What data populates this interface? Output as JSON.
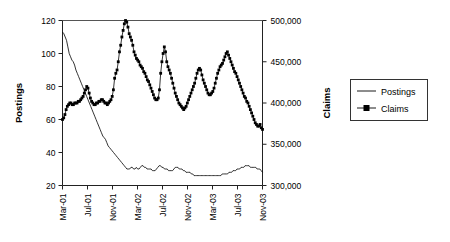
{
  "chart_data": {
    "type": "line",
    "title": "",
    "xlabel": "",
    "grid": false,
    "legend_position": "right",
    "x_tick_labels": [
      "Mar-01",
      "Jul-01",
      "Nov-01",
      "Mar-02",
      "Jul-02",
      "Nov-02",
      "Mar-03",
      "Jul-03",
      "Nov-03"
    ],
    "x": [
      "Mar-01",
      "Apr-01",
      "May-01",
      "Jun-01",
      "Jul-01",
      "Aug-01",
      "Sep-01",
      "Oct-01",
      "Nov-01",
      "Dec-01",
      "Jan-02",
      "Feb-02",
      "Mar-02",
      "Apr-02",
      "May-02",
      "Jun-02",
      "Jul-02",
      "Aug-02",
      "Sep-02",
      "Oct-02",
      "Nov-02",
      "Dec-02",
      "Jan-03",
      "Feb-03",
      "Mar-03",
      "Apr-03",
      "May-03",
      "Jun-03",
      "Jul-03",
      "Aug-03",
      "Sep-03",
      "Oct-03",
      "Nov-03"
    ],
    "left_axis": {
      "label": "Postings",
      "ylim": [
        20,
        120
      ],
      "ticks": [
        20,
        40,
        60,
        80,
        100,
        120
      ],
      "tick_labels": [
        "20",
        "40",
        "60",
        "80",
        "100",
        "120"
      ]
    },
    "right_axis": {
      "label": "Claims",
      "ylim": [
        300000,
        500000
      ],
      "ticks": [
        300000,
        350000,
        400000,
        450000,
        500000
      ],
      "tick_labels": [
        "300,000",
        "350,000",
        "400,000",
        "450,000",
        "500,000"
      ]
    },
    "series": [
      {
        "name": "Postings",
        "axis": "left",
        "marker": "none",
        "color": "#000000",
        "values_weekly": [
          113,
          112,
          110,
          108,
          104,
          100,
          98,
          96,
          95,
          93,
          90,
          88,
          86,
          84,
          82,
          80,
          78,
          76,
          74,
          72,
          70,
          68,
          66,
          64,
          62,
          60,
          58,
          56,
          54,
          52,
          50,
          49,
          48,
          46,
          44,
          43,
          42,
          41,
          40,
          39,
          38,
          37,
          36,
          35,
          34,
          33,
          32,
          31,
          30,
          30,
          30,
          31,
          31,
          30,
          30,
          31,
          30,
          30,
          31,
          32,
          32,
          31,
          31,
          30,
          30,
          30,
          30,
          29,
          29,
          29,
          30,
          31,
          32,
          32,
          31,
          31,
          30,
          30,
          30,
          29,
          29,
          29,
          29,
          30,
          31,
          31,
          31,
          30,
          30,
          30,
          29,
          29,
          28,
          28,
          28,
          28,
          27,
          27,
          26,
          26,
          26,
          26,
          26,
          26,
          26,
          26,
          26,
          26,
          26,
          26,
          26,
          26,
          26,
          26,
          26,
          26,
          26,
          26,
          26,
          27,
          27,
          27,
          27,
          27,
          28,
          28,
          28,
          29,
          29,
          29,
          30,
          30,
          30,
          31,
          31,
          31,
          32,
          32,
          32,
          32,
          31,
          31,
          31,
          31,
          31,
          30,
          30,
          30,
          29,
          28
        ]
      },
      {
        "name": "Claims",
        "axis": "right",
        "marker": "square",
        "color": "#000000",
        "values_weekly": [
          60,
          61,
          63,
          66,
          68,
          69,
          70,
          70,
          69,
          69,
          70,
          70,
          70,
          71,
          71,
          72,
          73,
          74,
          76,
          78,
          80,
          79,
          76,
          73,
          71,
          70,
          69,
          69,
          70,
          70,
          71,
          71,
          72,
          72,
          71,
          70,
          70,
          69,
          70,
          71,
          72,
          74,
          78,
          85,
          88,
          90,
          95,
          101,
          105,
          110,
          114,
          118,
          120,
          119,
          116,
          112,
          110,
          108,
          105,
          101,
          99,
          97,
          96,
          95,
          93,
          92,
          91,
          89,
          88,
          86,
          84,
          83,
          81,
          79,
          77,
          75,
          73,
          72,
          72,
          73,
          78,
          88,
          95,
          100,
          104,
          101,
          95,
          92,
          90,
          88,
          85,
          82,
          79,
          76,
          74,
          72,
          70,
          69,
          68,
          67,
          66,
          67,
          68,
          70,
          72,
          74,
          76,
          78,
          80,
          82,
          85,
          88,
          90,
          91,
          90,
          87,
          84,
          82,
          80,
          78,
          76,
          75,
          75,
          76,
          77,
          79,
          82,
          85,
          88,
          90,
          92,
          93,
          94,
          96,
          98,
          100,
          101,
          99,
          97,
          95,
          93,
          91,
          89,
          88,
          86,
          84,
          82,
          80,
          78,
          76,
          74,
          73,
          71,
          70,
          68,
          66,
          64,
          62,
          60,
          58,
          57,
          56,
          56,
          57,
          55,
          54
        ]
      }
    ],
    "notes": {
      "postings_start": 113,
      "postings_min": 26,
      "postings_end": 31,
      "claims_peak_value": 120,
      "claims_peak_date": "Nov-01",
      "claims_start": 60,
      "claims_end": 55
    }
  },
  "legend": {
    "items": [
      {
        "label": "Postings",
        "marker": "line"
      },
      {
        "label": "Claims",
        "marker": "line-square"
      }
    ]
  }
}
